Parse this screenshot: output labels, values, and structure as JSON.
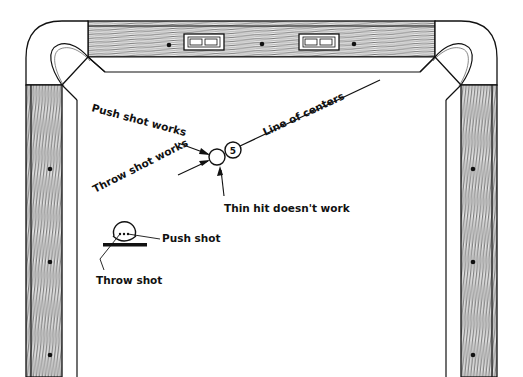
{
  "diagram": {
    "labels": {
      "push_shot_works": "Push shot works",
      "throw_shot_works": "Throw shot works",
      "thin_hit": "Thin hit doesn't work",
      "line_of_centers": "Line of centers",
      "push_shot": "Push shot",
      "throw_shot": "Throw shot"
    },
    "object_ball_number": "5",
    "rail_plates": [
      "B3B",
      "B3B"
    ],
    "colors": {
      "ink": "#111111",
      "paper": "#ffffff"
    }
  }
}
